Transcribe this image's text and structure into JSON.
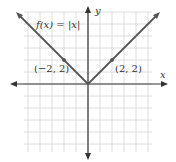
{
  "chart_data": {
    "type": "line",
    "title": "",
    "function_label": "f(x) = |x|",
    "xlabel": "x",
    "ylabel": "y",
    "xlim": [
      -5,
      5
    ],
    "ylim": [
      -6,
      6
    ],
    "grid": true,
    "series": [
      {
        "name": "f(x) = |x|",
        "x": [
          -5.5,
          0,
          5.5
        ],
        "y": [
          5.5,
          0,
          5.5
        ]
      }
    ],
    "points": [
      {
        "x": -2,
        "y": 2,
        "label": "(−2, 2)"
      },
      {
        "x": 2,
        "y": 2,
        "label": "(2, 2)"
      }
    ],
    "colors": {
      "line": "#555555",
      "axis": "#333333",
      "grid": "#d6d6d6"
    }
  }
}
